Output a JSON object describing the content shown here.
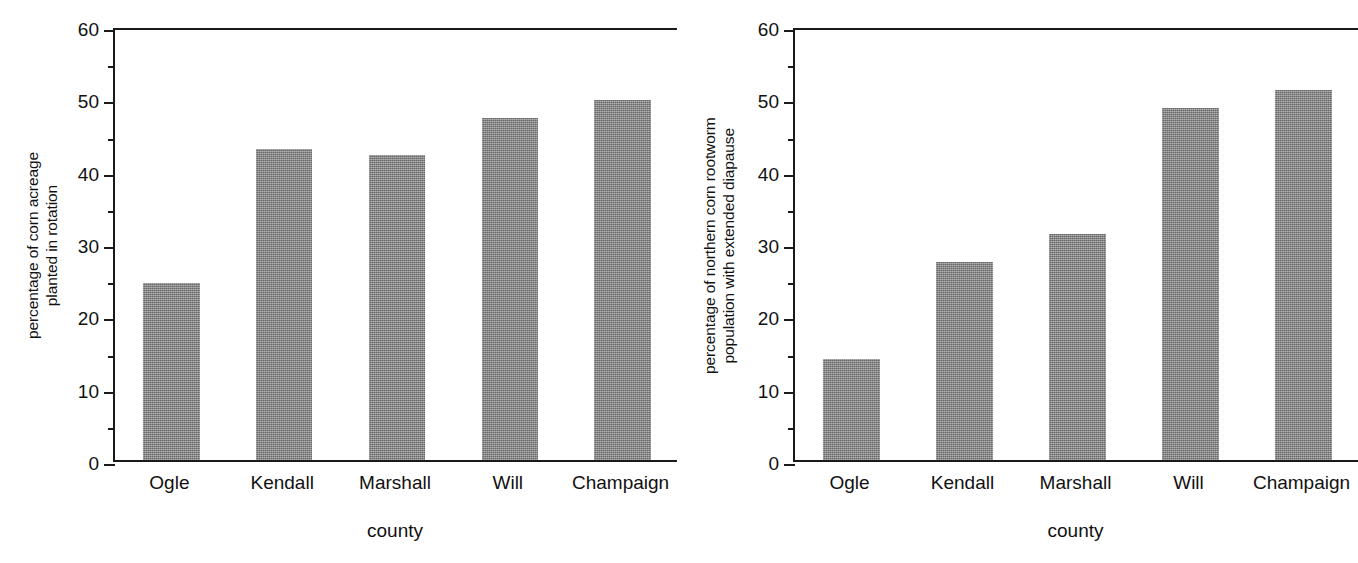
{
  "figure": {
    "background": "#ffffff",
    "bar_color": "#878787",
    "axis_color": "#1a1a1a"
  },
  "chart_data": [
    {
      "type": "bar",
      "panel": "left",
      "title": "",
      "categories": [
        "Ogle",
        "Kendall",
        "Marshall",
        "Will",
        "Champaign"
      ],
      "values": [
        24.5,
        43.0,
        42.2,
        47.3,
        49.8
      ],
      "xlabel": "county",
      "ylabel": "percentage of corn acreage planted in rotation",
      "ylabel_lines": [
        "percentage of corn acreage",
        "planted in rotation"
      ],
      "yticks": [
        0,
        10,
        20,
        30,
        40,
        50,
        60
      ],
      "ytick_labels": [
        "0",
        "10",
        "20",
        "30",
        "40",
        "50",
        "60"
      ],
      "ylim": [
        0,
        60
      ],
      "grid": false,
      "legend": null
    },
    {
      "type": "bar",
      "panel": "right",
      "title": "",
      "categories": [
        "Ogle",
        "Kendall",
        "Marshall",
        "Will",
        "Champaign"
      ],
      "values": [
        13.9,
        27.4,
        31.3,
        48.6,
        51.1
      ],
      "xlabel": "county",
      "ylabel": "percentage of northern corn rootworm population with extended diapause",
      "ylabel_lines": [
        "percentage of northern corn rootworm",
        "population with extended diapause"
      ],
      "yticks": [
        0,
        10,
        20,
        30,
        40,
        50,
        60
      ],
      "ytick_labels": [
        "0",
        "10",
        "20",
        "30",
        "40",
        "50",
        "60"
      ],
      "ylim": [
        0,
        60
      ],
      "grid": false,
      "legend": null
    }
  ]
}
